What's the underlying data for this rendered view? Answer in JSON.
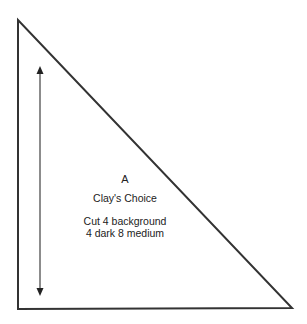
{
  "diagram": {
    "type": "quilt-template",
    "shape": "right-triangle",
    "piece_letter": "A",
    "block_name": "Clay's Choice",
    "cutting_instructions": {
      "line1": "Cut 4 background",
      "line2": "4 dark 8 medium"
    },
    "grain_arrow": "double-headed vertical",
    "colors": {
      "outline": "#333333",
      "arrow": "#555555",
      "text": "#222222",
      "background": "#ffffff"
    }
  }
}
